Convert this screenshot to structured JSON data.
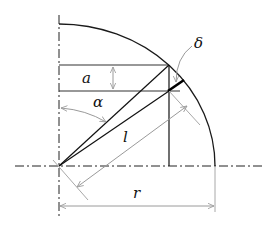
{
  "diagram": {
    "type": "geometry",
    "labels": {
      "a": "a",
      "alpha": "α",
      "l": "l",
      "r": "r",
      "delta": "δ"
    },
    "colors": {
      "line": "#1a1a1a",
      "dimension": "#a8a8a8",
      "background": "#ffffff"
    }
  }
}
